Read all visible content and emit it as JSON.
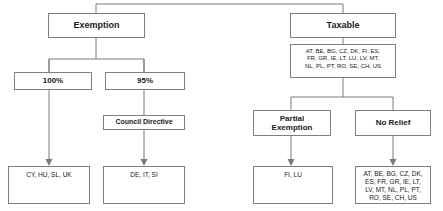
{
  "diagram": {
    "accent_border": "#808080",
    "line_color": "#7a7a7a",
    "background": "#ffffff",
    "nodes": {
      "exemption": {
        "label": "Exemption"
      },
      "taxable": {
        "label": "Taxable"
      },
      "taxable_countries": {
        "label": "AT, BE, BG, CZ, DK, FI, ES,\nFR, GR, IE, LT, LU, LV, MT,\nNL, PL, PT, RO, SE, CH, US"
      },
      "hundred_percent": {
        "label": "100%"
      },
      "ninetyfive_percent": {
        "label": "95%"
      },
      "council_directive": {
        "label": "Council Directive"
      },
      "partial_exemption": {
        "label": "Partial\nExemption"
      },
      "no_relief": {
        "label": "No Relief"
      },
      "exempt_full_countries": {
        "label": "CY, HU, SL, UK"
      },
      "exempt_partial_countries": {
        "label": "DE, IT, SI"
      },
      "partial_exemption_countries": {
        "label": "FI, LU"
      },
      "no_relief_countries": {
        "label": "AT, BE, BG, CZ, DK,\nES, FR, GR, IE, LT,\nLV, MT, NL, PL, PT,\nRO, SE, CH, US"
      }
    }
  }
}
